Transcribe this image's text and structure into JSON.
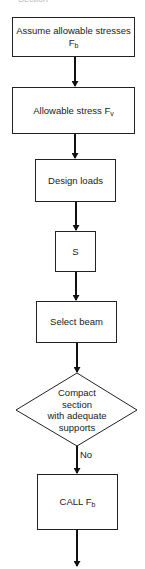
{
  "caption": "Section",
  "nodes": [
    {
      "id": "assume-stress",
      "type": "process",
      "text": "Assume allowable stresses F",
      "sub": "b"
    },
    {
      "id": "allowable-stress",
      "type": "process",
      "text": "Allowable stress F",
      "sub": "v"
    },
    {
      "id": "design-loads",
      "type": "process",
      "text": "Design loads"
    },
    {
      "id": "section-modulus",
      "type": "process",
      "text": "S"
    },
    {
      "id": "select-beam",
      "type": "process",
      "text": "Select beam"
    },
    {
      "id": "compact-check",
      "type": "decision",
      "lines": [
        "Compact",
        "section",
        "with adequate",
        "supports"
      ]
    },
    {
      "id": "call-fb",
      "type": "process",
      "text": "CALL F",
      "sub": "b"
    }
  ],
  "edges": [
    {
      "from": "assume-stress",
      "to": "allowable-stress"
    },
    {
      "from": "allowable-stress",
      "to": "design-loads"
    },
    {
      "from": "design-loads",
      "to": "section-modulus"
    },
    {
      "from": "section-modulus",
      "to": "select-beam"
    },
    {
      "from": "select-beam",
      "to": "compact-check"
    },
    {
      "from": "compact-check",
      "to": "call-fb",
      "label": "No"
    },
    {
      "from": "call-fb",
      "to": "continuation"
    }
  ]
}
